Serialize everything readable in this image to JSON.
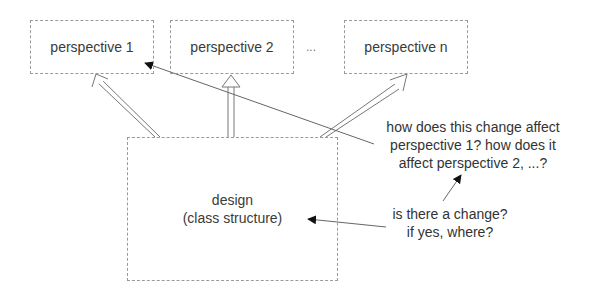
{
  "diagram": {
    "perspectives": [
      {
        "label": "perspective 1"
      },
      {
        "label": "perspective 2"
      },
      {
        "label": "perspective n"
      }
    ],
    "ellipsis": "...",
    "design": {
      "line1": "design",
      "line2": "(class structure)"
    },
    "annotations": {
      "question_affect": {
        "line1": "how does this change affect",
        "line2": "perspective 1? how does it",
        "line3": "affect perspective 2, ...?"
      },
      "question_change": {
        "line1": "is there a change?",
        "line2": "if yes, where?"
      }
    },
    "colors": {
      "border": "#9a9a9a",
      "line": "#555555",
      "arrowhead": "#111111",
      "text": "#333333"
    }
  }
}
